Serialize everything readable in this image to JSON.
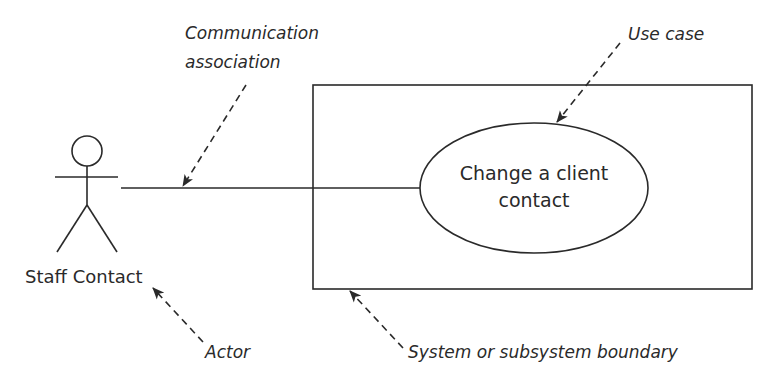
{
  "diagram": {
    "type": "UML use case diagram",
    "actor": {
      "name": "Staff Contact"
    },
    "use_case": {
      "line1": "Change a client",
      "line2": "contact"
    },
    "annotations": {
      "communication_association": {
        "line1": "Communication",
        "line2": "association"
      },
      "use_case": "Use case",
      "actor": "Actor",
      "system_boundary": "System or subsystem boundary"
    },
    "colors": {
      "stroke": "#2a2a2a",
      "background": "#ffffff"
    }
  }
}
